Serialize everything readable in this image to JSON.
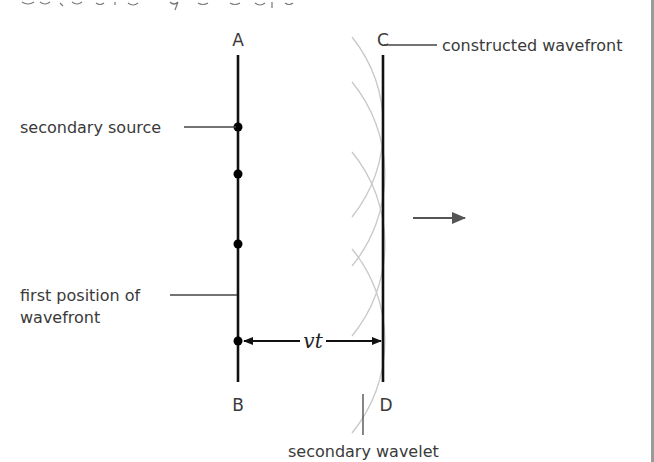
{
  "diagram": {
    "caption_clipped": "",
    "colors": {
      "wavefront": "#111111",
      "wavelet": "#c8c8c8",
      "leader": "#444444",
      "text": "#3a3a3a",
      "border": "#9a9a9a"
    },
    "points": {
      "A": "A",
      "B": "B",
      "C": "C",
      "D": "D"
    },
    "labels": {
      "constructed_wavefront": "constructed wavefront",
      "secondary_source": "secondary source",
      "first_position_line1": "first position of",
      "first_position_line2": "wavefront",
      "secondary_wavelet": "secondary wavelet",
      "distance": "vt"
    },
    "geometry": {
      "first_wavefront_x": 238,
      "constructed_wavefront_x": 383,
      "wavefront_top_y": 55,
      "wavefront_bottom_y": 382,
      "secondary_sources_y": [
        127,
        174,
        244,
        341
      ],
      "wavelet_radius": 145,
      "propagation_arrow": {
        "x1": 413,
        "x2": 465,
        "y": 218
      }
    }
  }
}
